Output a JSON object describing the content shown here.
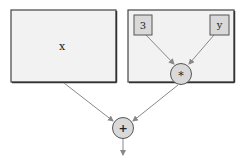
{
  "diagram": {
    "type": "expression-tree",
    "left_box": {
      "label": "x"
    },
    "right_box": {
      "nodes": [
        {
          "id": "const",
          "label": "3"
        },
        {
          "id": "var",
          "label": "y"
        }
      ],
      "operator": {
        "label": "*"
      }
    },
    "root": {
      "label": "+"
    },
    "edges": [
      {
        "from": "3",
        "to": "*"
      },
      {
        "from": "y",
        "to": "*"
      },
      {
        "from": "left_box",
        "to": "+"
      },
      {
        "from": "*",
        "to": "+"
      },
      {
        "from": "+",
        "to": "output"
      }
    ]
  },
  "colors": {
    "box_fill": "#f2f2f2",
    "box_border": "#555555",
    "node_fill": "#d9d9d9",
    "node_border": "#555555",
    "edge": "#888888"
  }
}
